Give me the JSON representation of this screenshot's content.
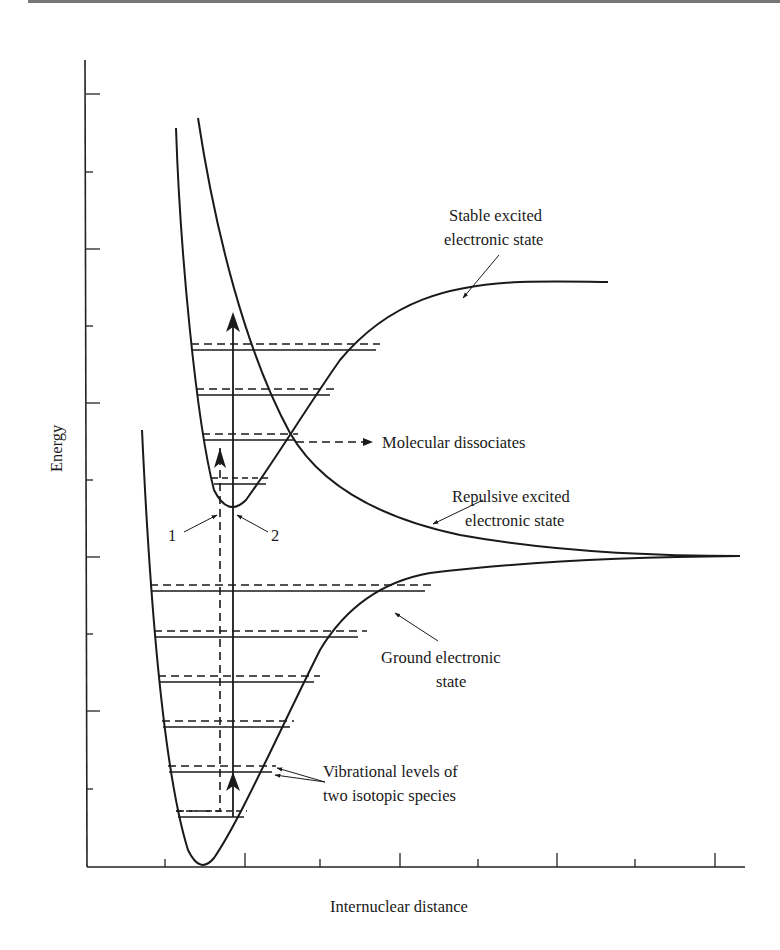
{
  "diagram": {
    "type": "potential-energy-curves",
    "axes": {
      "ylabel": "Energy",
      "xlabel": "Internuclear distance",
      "y_ticks_count": 10,
      "x_ticks_count": 8
    },
    "curves": [
      {
        "name": "ground",
        "label_lines": [
          "Ground electronic",
          "state"
        ]
      },
      {
        "name": "stable-excited",
        "label_lines": [
          "Stable excited",
          "electronic state"
        ]
      },
      {
        "name": "repulsive-excited",
        "label_lines": [
          "Repulsive excited",
          "electronic state"
        ]
      }
    ],
    "annotations": {
      "dissociation": "Molecular dissociates",
      "vibrational": [
        "Vibrational levels of",
        "two isotopic species"
      ],
      "transition_1": "1",
      "transition_2": "2"
    },
    "vibrational_levels": {
      "ground_count": 6,
      "excited_count": 4,
      "style": "solid = species A, dashed = species B"
    }
  }
}
